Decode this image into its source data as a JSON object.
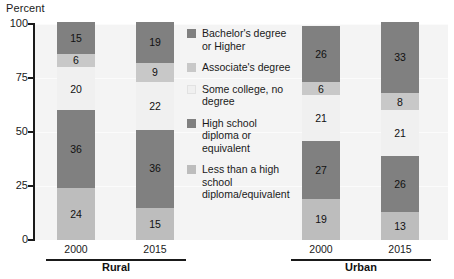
{
  "chart_data": {
    "type": "bar",
    "subtype": "stacked-bar",
    "title": "",
    "ylabel": "Percent",
    "xlabel": "",
    "ylim": [
      0,
      100
    ],
    "yticks": [
      0,
      25,
      50,
      75,
      100
    ],
    "grid": true,
    "legend_position": "center",
    "categories": [
      "2000",
      "2015",
      "2000",
      "2015"
    ],
    "groups": [
      {
        "label": "Rural",
        "categories": [
          "2000",
          "2015"
        ]
      },
      {
        "label": "Urban",
        "categories": [
          "2000",
          "2015"
        ]
      }
    ],
    "series": [
      {
        "name": "Less than a high school diploma/equivalent",
        "color": "#bdbdbd",
        "values": [
          24,
          15,
          19,
          13
        ]
      },
      {
        "name": "High school diploma or equivalent",
        "color": "#808080",
        "values": [
          36,
          36,
          27,
          26
        ]
      },
      {
        "name": "Some college, no degree",
        "color": "#f0f0f0",
        "values": [
          20,
          22,
          21,
          21
        ]
      },
      {
        "name": "Associate's degree",
        "color": "#c8c8c8",
        "values": [
          6,
          9,
          6,
          8
        ]
      },
      {
        "name": "Bachelor's degree or Higher",
        "color": "#808080",
        "values": [
          15,
          19,
          26,
          33
        ]
      }
    ],
    "legend_order": [
      "Bachelor's degree or Higher",
      "Associate's degree",
      "Some college, no degree",
      "High school diploma or equivalent",
      "Less than a high school diploma/equivalent"
    ]
  },
  "legend": {
    "items": [
      {
        "label": "Bachelor's degree or Higher",
        "color": "#808080"
      },
      {
        "label": "Associate's degree",
        "color": "#c8c8c8"
      },
      {
        "label": "Some college, no degree",
        "color": "#f0f0f0"
      },
      {
        "label": "High school diploma or equivalent",
        "color": "#808080"
      },
      {
        "label": "Less than a high school diploma/equivalent",
        "color": "#bdbdbd"
      }
    ]
  },
  "axis": {
    "y_title": "Percent",
    "y_ticks": [
      "100",
      "75",
      "50",
      "25",
      "0"
    ]
  }
}
